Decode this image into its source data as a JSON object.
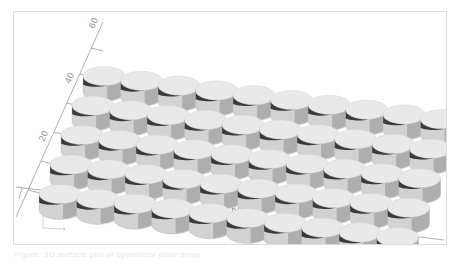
{
  "figure": {
    "title": "",
    "caption": "Figure: 3D surface plot of cylindrical pillar array"
  },
  "chart_data": {
    "type": "bar",
    "subtype": "3d-cylinder-array",
    "title": "",
    "xlabel": "",
    "ylabel": "",
    "zlabel": "",
    "grid": false,
    "legend": null,
    "projection": "isometric-3d",
    "rows": 5,
    "cols": 10,
    "count": 50,
    "marker_shape": "cylinder",
    "x_axis": {
      "ticks": [
        20,
        40,
        60,
        80,
        100
      ],
      "tick_labels": [
        "20",
        "40",
        "60",
        "80",
        "100"
      ],
      "minor_ticks": [
        10,
        30,
        50,
        70,
        90
      ],
      "range": [
        0,
        110
      ]
    },
    "y_axis": {
      "ticks": [
        20,
        40,
        60
      ],
      "tick_labels": [
        "20",
        "40",
        "60"
      ],
      "minor_ticks": [
        10,
        30,
        50
      ],
      "range": [
        0,
        70
      ]
    },
    "series": [
      {
        "name": "row-1",
        "y": 10,
        "x": [
          10,
          20,
          30,
          40,
          50,
          60,
          70,
          80,
          90,
          100
        ],
        "values": [
          1,
          1,
          1,
          1,
          1,
          1,
          1,
          1,
          1,
          1
        ]
      },
      {
        "name": "row-2",
        "y": 22,
        "x": [
          10,
          20,
          30,
          40,
          50,
          60,
          70,
          80,
          90,
          100
        ],
        "values": [
          1,
          1,
          1,
          1,
          1,
          1,
          1,
          1,
          1,
          1
        ]
      },
      {
        "name": "row-3",
        "y": 34,
        "x": [
          10,
          20,
          30,
          40,
          50,
          60,
          70,
          80,
          90,
          100
        ],
        "values": [
          1,
          1,
          1,
          1,
          1,
          1,
          1,
          1,
          1,
          1
        ]
      },
      {
        "name": "row-4",
        "y": 46,
        "x": [
          10,
          20,
          30,
          40,
          50,
          60,
          70,
          80,
          90,
          100
        ],
        "values": [
          1,
          1,
          1,
          1,
          1,
          1,
          1,
          1,
          1,
          1
        ]
      },
      {
        "name": "row-5",
        "y": 58,
        "x": [
          10,
          20,
          30,
          40,
          50,
          60,
          70,
          80,
          90,
          100
        ],
        "values": [
          1,
          1,
          1,
          1,
          1,
          1,
          1,
          1,
          1,
          1
        ]
      }
    ],
    "colors": {
      "top_face": "#e9e9e9",
      "side_dark": "#3a3a3a",
      "side_mid": "#8f8f8f",
      "side_light": "#d2d2d2",
      "axis": "#9a9a9a",
      "tick_label": "#8a8a8a",
      "frame": "#dcdcdc",
      "background": "#ffffff"
    }
  }
}
